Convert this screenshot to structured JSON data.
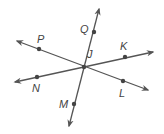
{
  "diagram": {
    "type": "geometry-intersecting-lines",
    "colors": {
      "line": "#555555",
      "point": "#444444",
      "label": "#444444"
    },
    "intersection": {
      "label": "J",
      "x": 84,
      "y": 67,
      "label_x": 87,
      "label_y": 58
    },
    "lines": [
      {
        "name": "line-QM",
        "x1": 99,
        "y1": 9,
        "x2": 69,
        "y2": 126
      },
      {
        "name": "line-PL",
        "x1": 17,
        "y1": 41,
        "x2": 148,
        "y2": 90
      },
      {
        "name": "line-NK",
        "x1": 15,
        "y1": 82,
        "x2": 153,
        "y2": 52
      }
    ],
    "points": [
      {
        "label": "Q",
        "x": 94,
        "y": 32,
        "label_x": 80,
        "label_y": 33
      },
      {
        "label": "P",
        "x": 39,
        "y": 49,
        "label_x": 37,
        "label_y": 43
      },
      {
        "label": "K",
        "x": 125,
        "y": 57,
        "label_x": 120,
        "label_y": 50
      },
      {
        "label": "N",
        "x": 37,
        "y": 77,
        "label_x": 32,
        "label_y": 92
      },
      {
        "label": "L",
        "x": 123,
        "y": 81,
        "label_x": 119,
        "label_y": 97
      },
      {
        "label": "M",
        "x": 74,
        "y": 104,
        "label_x": 59,
        "label_y": 108
      }
    ]
  }
}
